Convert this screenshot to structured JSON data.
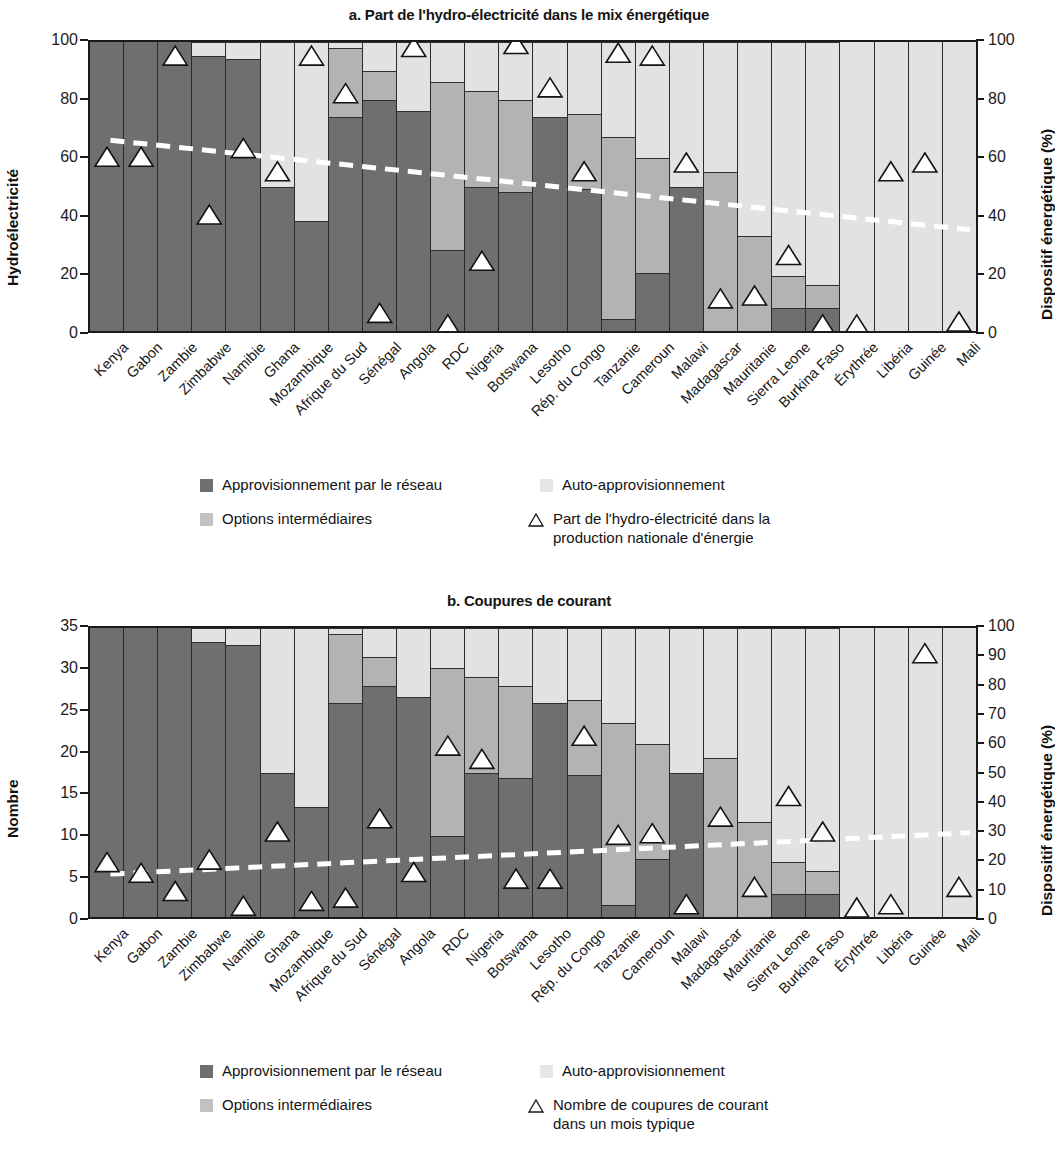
{
  "colors": {
    "grid_supply": "#6f6f6f",
    "intermediate": "#b3b3b3",
    "self_supply": "#e2e2e2",
    "trend_line": "#ffffff",
    "axis": "#1a1a1a"
  },
  "panel_a": {
    "title": "a. Part de l'hydro-électricité dans le mix énergétique",
    "left_axis_title": "Hydroélectricité",
    "right_axis_title": "Dispositif énergétique (%)",
    "left_ticks": [
      "100",
      "80",
      "60",
      "40",
      "20",
      "0"
    ],
    "right_ticks": [
      "100",
      "80",
      "60",
      "40",
      "20",
      "0"
    ],
    "legend": {
      "grid_supply": "Approvisionnement par le réseau",
      "self_supply": "Auto-approvisionnement",
      "intermediate": "Options intermédiaires",
      "marker_line1": "Part de l'hydro-électricité dans la",
      "marker_line2": "production nationale d'énergie"
    }
  },
  "panel_b": {
    "title": "b. Coupures de courant",
    "left_axis_title": "Nombre",
    "right_axis_title": "Dispositif énergétique (%)",
    "left_ticks": [
      "35",
      "30",
      "25",
      "20",
      "15",
      "10",
      "5",
      "0"
    ],
    "right_ticks": [
      "100",
      "90",
      "80",
      "70",
      "60",
      "50",
      "40",
      "30",
      "20",
      "10",
      "0"
    ],
    "legend": {
      "grid_supply": "Approvisionnement par le réseau",
      "self_supply": "Auto-approvisionnement",
      "intermediate": "Options intermédiaires",
      "marker_line1": "Nombre de coupures de courant",
      "marker_line2": "dans un mois typique"
    }
  },
  "chart_data": [
    {
      "type": "bar",
      "panel": "a",
      "title": "a. Part de l'hydro-électricité dans le mix énergétique",
      "stacked": true,
      "ylabel": "Hydroélectricité",
      "ylabel_right": "Dispositif énergétique (%)",
      "ylim": [
        0,
        100
      ],
      "yticks": [
        0,
        20,
        40,
        60,
        80,
        100
      ],
      "ylim_right": [
        0,
        100
      ],
      "yticks_right": [
        0,
        20,
        40,
        60,
        80,
        100
      ],
      "grid": false,
      "legend_position": "below",
      "categories": [
        "Kenya",
        "Gabon",
        "Zambie",
        "Zimbabwe",
        "Namibie",
        "Ghana",
        "Mozambique",
        "Afrique du Sud",
        "Sénégal",
        "Angola",
        "RDC",
        "Nigeria",
        "Botswana",
        "Lesotho",
        "Rép. du Congo",
        "Tanzanie",
        "Cameroun",
        "Malawi",
        "Madagascar",
        "Mauritanie",
        "Sierra Leone",
        "Burkina Faso",
        "Érythrée",
        "Libéria",
        "Guinée",
        "Mali"
      ],
      "series": [
        {
          "name": "Approvisionnement par le réseau",
          "color": "#6f6f6f",
          "values": [
            100,
            100,
            100,
            95,
            94,
            50,
            38,
            74,
            80,
            76,
            28,
            50,
            48,
            74,
            49,
            4,
            20,
            50,
            0,
            0,
            8,
            8,
            0,
            0,
            0,
            0
          ]
        },
        {
          "name": "Options intermédiaires",
          "color": "#b3b3b3",
          "values": [
            0,
            0,
            0,
            0,
            0,
            0,
            0,
            24,
            10,
            0,
            58,
            33,
            32,
            0,
            26,
            63,
            40,
            0,
            55,
            33,
            11,
            8,
            0,
            0,
            0,
            0
          ]
        },
        {
          "name": "Auto-approvisionnement",
          "color": "#e2e2e2",
          "values": [
            0,
            0,
            0,
            5,
            6,
            50,
            62,
            2,
            10,
            24,
            14,
            17,
            20,
            26,
            25,
            33,
            40,
            50,
            45,
            67,
            81,
            84,
            100,
            100,
            100,
            100
          ]
        }
      ],
      "marker_series": {
        "name": "Part de l'hydro-électricité dans la production nationale d'énergie",
        "symbol": "triangle-up",
        "values": [
          57,
          57,
          92,
          37,
          60,
          52,
          92,
          79,
          3,
          95,
          -1,
          21,
          96,
          81,
          52,
          93,
          92,
          55,
          8,
          9,
          23,
          -1,
          -1,
          52,
          55,
          0
        ]
      },
      "trend_line": {
        "name": "tendance",
        "style": "dashed",
        "color": "#ffffff",
        "y_start": 66,
        "y_end": 35
      }
    },
    {
      "type": "bar",
      "panel": "b",
      "title": "b. Coupures de courant",
      "stacked": true,
      "ylabel": "Nombre",
      "ylabel_right": "Dispositif énergétique (%)",
      "ylim": [
        0,
        35
      ],
      "yticks": [
        0,
        5,
        10,
        15,
        20,
        25,
        30,
        35
      ],
      "ylim_right": [
        0,
        100
      ],
      "yticks_right": [
        0,
        10,
        20,
        30,
        40,
        50,
        60,
        70,
        80,
        90,
        100
      ],
      "grid": false,
      "legend_position": "below",
      "categories": [
        "Kenya",
        "Gabon",
        "Zambie",
        "Zimbabwe",
        "Namibie",
        "Ghana",
        "Mozambique",
        "Afrique du Sud",
        "Sénégal",
        "Angola",
        "RDC",
        "Nigeria",
        "Botswana",
        "Lesotho",
        "Rép. du Congo",
        "Tanzanie",
        "Cameroun",
        "Malawi",
        "Madagascar",
        "Mauritanie",
        "Sierra Leone",
        "Burkina Faso",
        "Érythrée",
        "Libéria",
        "Guinée",
        "Mali"
      ],
      "series": [
        {
          "name": "Approvisionnement par le réseau",
          "color": "#6f6f6f",
          "values": [
            100,
            100,
            100,
            95,
            94,
            50,
            38,
            74,
            80,
            76,
            28,
            50,
            48,
            74,
            49,
            4,
            20,
            50,
            0,
            0,
            8,
            8,
            0,
            0,
            0,
            0
          ]
        },
        {
          "name": "Options intermédiaires",
          "color": "#b3b3b3",
          "values": [
            0,
            0,
            0,
            0,
            0,
            0,
            0,
            24,
            10,
            0,
            58,
            33,
            32,
            0,
            26,
            63,
            40,
            0,
            55,
            33,
            11,
            8,
            0,
            0,
            0,
            0
          ]
        },
        {
          "name": "Auto-approvisionnement",
          "color": "#e2e2e2",
          "values": [
            0,
            0,
            0,
            5,
            6,
            50,
            62,
            2,
            10,
            24,
            14,
            17,
            20,
            26,
            25,
            33,
            40,
            50,
            45,
            67,
            81,
            84,
            100,
            100,
            100,
            100
          ]
        }
      ],
      "marker_series": {
        "name": "Nombre de coupures de courant dans un mois typique",
        "symbol": "triangle-up",
        "values": [
          5.5,
          4.2,
          2.0,
          5.8,
          0.2,
          9.2,
          0.8,
          1.2,
          10.8,
          4.3,
          19.6,
          18.0,
          3.5,
          3.5,
          20.8,
          8.8,
          9.0,
          0.4,
          11.0,
          2.5,
          13.5,
          9.2,
          0.0,
          0.4,
          30.8,
          2.5
        ]
      },
      "trend_line": {
        "name": "tendance",
        "style": "dashed",
        "color": "#ffffff",
        "y_start": 5.2,
        "y_end": 10.2
      }
    }
  ]
}
